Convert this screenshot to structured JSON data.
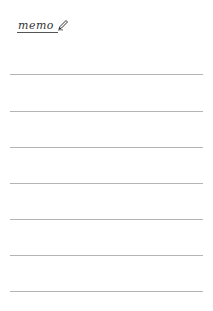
{
  "memo": {
    "title": "memo",
    "icon": "pencil-icon",
    "colors": {
      "background": "#ffffff",
      "title": "#333333",
      "rule": "#b4b4b4"
    },
    "ruled_lines": {
      "count": 7,
      "positions_y": [
        74,
        111,
        147,
        183,
        219,
        255,
        291
      ]
    }
  }
}
